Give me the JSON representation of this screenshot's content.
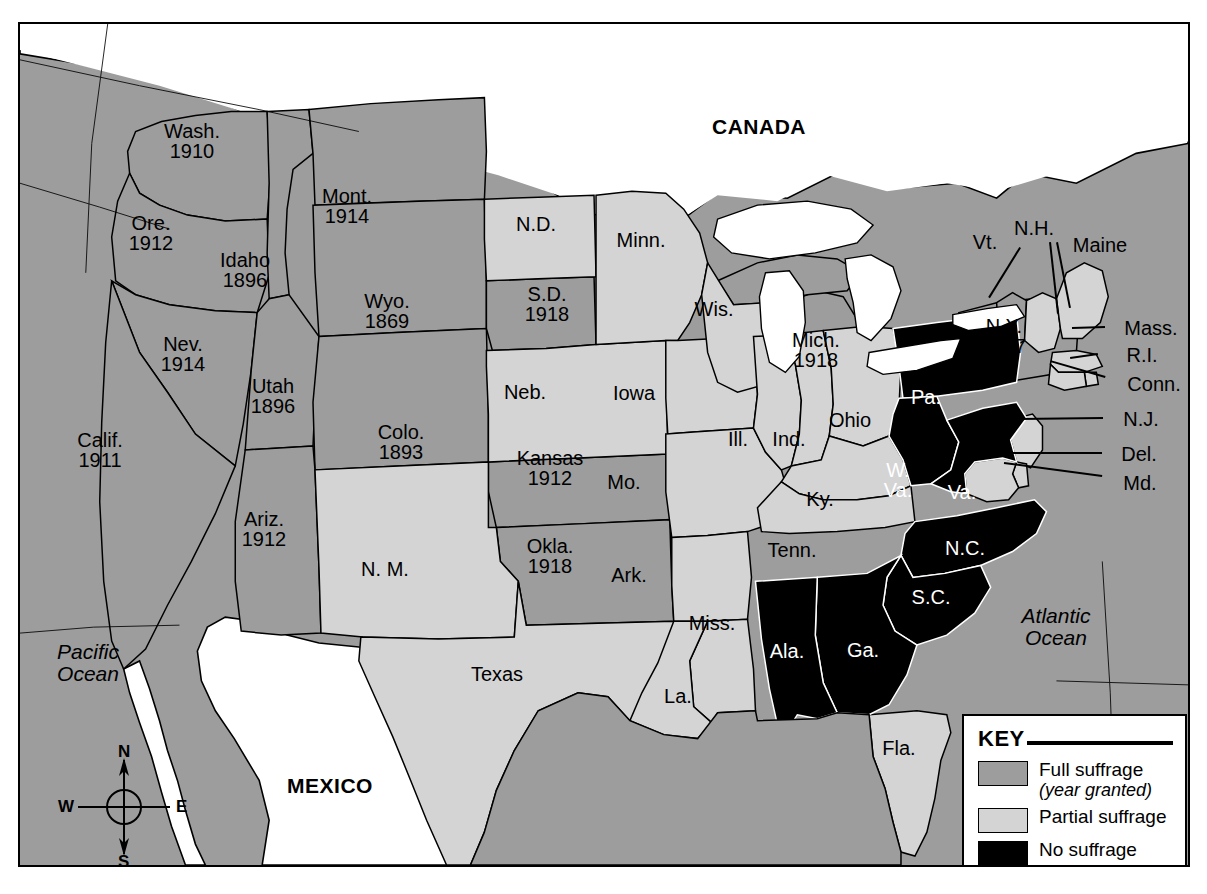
{
  "map": {
    "title_fragment": "",
    "countries": [
      {
        "name": "CANADA",
        "x": 757,
        "y": 125
      },
      {
        "name": "MEXICO",
        "x": 328,
        "y": 784
      }
    ],
    "oceans": [
      {
        "name": "Pacific\nOcean",
        "line1": "Pacific",
        "line2": "Ocean",
        "x": 86,
        "y": 661
      },
      {
        "name": "Atlantic\nOcean",
        "line1": "Atlantic",
        "line2": "Ocean",
        "x": 1054,
        "y": 625
      }
    ],
    "states": [
      {
        "abbr": "Wash.",
        "year": "1910",
        "status": "full",
        "x": 190,
        "y": 139
      },
      {
        "abbr": "Ore.",
        "year": "1912",
        "status": "full",
        "x": 149,
        "y": 231
      },
      {
        "abbr": "Idaho",
        "year": "1896",
        "status": "full",
        "x": 243,
        "y": 268
      },
      {
        "abbr": "Mont.",
        "year": "1914",
        "status": "full",
        "x": 345,
        "y": 204
      },
      {
        "abbr": "Wyo.",
        "year": "1869",
        "status": "full",
        "x": 385,
        "y": 309
      },
      {
        "abbr": "Nev.",
        "year": "1914",
        "status": "full",
        "x": 181,
        "y": 352
      },
      {
        "abbr": "Utah",
        "year": "1896",
        "status": "full",
        "x": 271,
        "y": 394
      },
      {
        "abbr": "Calif.",
        "year": "1911",
        "status": "full",
        "x": 98,
        "y": 448
      },
      {
        "abbr": "Colo.",
        "year": "1893",
        "status": "full",
        "x": 399,
        "y": 440
      },
      {
        "abbr": "Ariz.",
        "year": "1912",
        "status": "full",
        "x": 262,
        "y": 527
      },
      {
        "abbr": "N. M.",
        "year": "",
        "status": "partial",
        "x": 383,
        "y": 567
      },
      {
        "abbr": "N.D.",
        "year": "",
        "status": "partial",
        "x": 534,
        "y": 222
      },
      {
        "abbr": "S.D.",
        "year": "1918",
        "status": "full",
        "x": 545,
        "y": 302
      },
      {
        "abbr": "Neb.",
        "year": "",
        "status": "partial",
        "x": 523,
        "y": 390
      },
      {
        "abbr": "Kansas",
        "year": "1912",
        "status": "full",
        "x": 548,
        "y": 466
      },
      {
        "abbr": "Okla.",
        "year": "1918",
        "status": "full",
        "x": 548,
        "y": 554
      },
      {
        "abbr": "Texas",
        "year": "",
        "status": "partial",
        "x": 495,
        "y": 672
      },
      {
        "abbr": "Minn.",
        "year": "",
        "status": "partial",
        "x": 639,
        "y": 238
      },
      {
        "abbr": "Iowa",
        "year": "",
        "status": "partial",
        "x": 632,
        "y": 391
      },
      {
        "abbr": "Mo.",
        "year": "",
        "status": "partial",
        "x": 622,
        "y": 480
      },
      {
        "abbr": "Ark.",
        "year": "",
        "status": "partial",
        "x": 627,
        "y": 573
      },
      {
        "abbr": "Miss.",
        "year": "",
        "status": "partial",
        "x": 710,
        "y": 621
      },
      {
        "abbr": "La.",
        "year": "",
        "status": "partial",
        "x": 676,
        "y": 694
      },
      {
        "abbr": "Wis.",
        "year": "",
        "status": "partial",
        "x": 712,
        "y": 307
      },
      {
        "abbr": "Ill.",
        "year": "",
        "status": "partial",
        "x": 736,
        "y": 437
      },
      {
        "abbr": "Ind.",
        "year": "",
        "status": "partial",
        "x": 787,
        "y": 437
      },
      {
        "abbr": "Mich.",
        "year": "1918",
        "status": "full",
        "x": 814,
        "y": 348
      },
      {
        "abbr": "Ohio",
        "year": "",
        "status": "partial",
        "x": 848,
        "y": 418
      },
      {
        "abbr": "Ky.",
        "year": "",
        "status": "partial",
        "x": 818,
        "y": 497
      },
      {
        "abbr": "Tenn.",
        "year": "",
        "status": "partial",
        "x": 790,
        "y": 548
      },
      {
        "abbr": "Fla.",
        "year": "",
        "status": "partial",
        "x": 897,
        "y": 746
      },
      {
        "abbr": "Pa.",
        "year": "",
        "status": "none",
        "x": 924,
        "y": 395
      },
      {
        "abbr": "W.\nVa.",
        "year": "",
        "status": "none",
        "x": 896,
        "y": 478
      },
      {
        "abbr": "Va.",
        "year": "",
        "status": "none",
        "x": 960,
        "y": 490
      },
      {
        "abbr": "N.C.",
        "year": "",
        "status": "none",
        "x": 963,
        "y": 546
      },
      {
        "abbr": "S.C.",
        "year": "",
        "status": "none",
        "x": 929,
        "y": 595
      },
      {
        "abbr": "Ga.",
        "year": "",
        "status": "none",
        "x": 861,
        "y": 648
      },
      {
        "abbr": "Ala.",
        "year": "",
        "status": "none",
        "x": 785,
        "y": 649
      },
      {
        "abbr": "N.Y.",
        "year": "1917",
        "status": "full",
        "x": 1002,
        "y": 334
      },
      {
        "abbr": "Vt.",
        "year": "",
        "status": "full",
        "x": 983,
        "y": 240
      },
      {
        "abbr": "N.H.",
        "year": "",
        "status": "partial",
        "x": 1032,
        "y": 226
      },
      {
        "abbr": "Maine",
        "year": "",
        "status": "partial",
        "x": 1098,
        "y": 243
      },
      {
        "abbr": "Mass.",
        "year": "",
        "status": "partial",
        "x": 1149,
        "y": 326
      },
      {
        "abbr": "R.I.",
        "year": "",
        "status": "partial",
        "x": 1140,
        "y": 353
      },
      {
        "abbr": "Conn.",
        "year": "",
        "status": "partial",
        "x": 1152,
        "y": 382
      },
      {
        "abbr": "N.J.",
        "year": "",
        "status": "partial",
        "x": 1139,
        "y": 417
      },
      {
        "abbr": "Del.",
        "year": "",
        "status": "partial",
        "x": 1137,
        "y": 452
      },
      {
        "abbr": "Md.",
        "year": "",
        "status": "partial",
        "x": 1138,
        "y": 481
      }
    ],
    "leaders": [
      {
        "name": "leader-vt",
        "x1": 1019,
        "y1": 246,
        "x2": 988,
        "y2": 296
      },
      {
        "name": "leader-nh",
        "x1": 1049,
        "y1": 240,
        "x2": 1057,
        "y2": 312
      },
      {
        "name": "leader-maine",
        "x1": 1056,
        "y1": 240,
        "x2": 1069,
        "y2": 306
      },
      {
        "name": "leader-mass",
        "x1": 1103,
        "y1": 326,
        "x2": 1070,
        "y2": 327
      },
      {
        "name": "leader-ri",
        "x1": 1096,
        "y1": 353,
        "x2": 1068,
        "y2": 357
      },
      {
        "name": "leader-conn",
        "x1": 1103,
        "y1": 376,
        "x2": 1048,
        "y2": 360
      },
      {
        "name": "leader-nj",
        "x1": 1101,
        "y1": 417,
        "x2": 1016,
        "y2": 418
      },
      {
        "name": "leader-del",
        "x1": 1100,
        "y1": 452,
        "x2": 1010,
        "y2": 452
      },
      {
        "name": "leader-md",
        "x1": 1100,
        "y1": 475,
        "x2": 1002,
        "y2": 462
      }
    ]
  },
  "compass": {
    "north": "N",
    "south": "S",
    "east": "E",
    "west": "W"
  },
  "key": {
    "title": "KEY",
    "items": [
      {
        "label": "Full suffrage",
        "sublabel": "(year granted)",
        "swatch": "full",
        "color": "#9d9d9d"
      },
      {
        "label": "Partial suffrage",
        "sublabel": "",
        "swatch": "partial",
        "color": "#d4d4d4"
      },
      {
        "label": "No suffrage",
        "sublabel": "",
        "swatch": "none",
        "color": "#000000"
      }
    ]
  },
  "colors": {
    "full_suffrage": "#9d9d9d",
    "partial_suffrage": "#d4d4d4",
    "no_suffrage": "#000000",
    "ocean": "#9d9d9d",
    "foreign_land": "#ffffff",
    "border": "#000000"
  }
}
